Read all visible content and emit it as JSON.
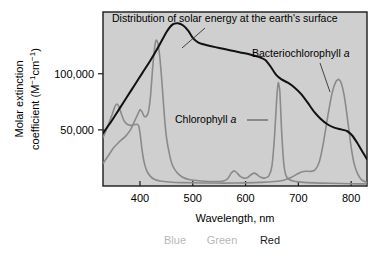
{
  "figure": {
    "background_color": "#ffffff",
    "plot_background_color": "#cfcfcf",
    "frame_color": "#1a1a1a"
  },
  "axes": {
    "x": {
      "title": "Wavelength, nm",
      "ticks": [
        400,
        500,
        600,
        700,
        800
      ],
      "tick_labels": [
        "400",
        "500",
        "600",
        "700",
        "800"
      ],
      "range": [
        330,
        830
      ]
    },
    "y": {
      "title_line1": "Molar extinction",
      "title_line2_prefix": "coefficient (M",
      "title_line2_sup1": "−1",
      "title_line2_mid": "cm",
      "title_line2_sup2": "−1",
      "title_line2_suffix": ")",
      "ticks": [
        50000,
        100000
      ],
      "tick_labels": [
        "50,000",
        "100,000"
      ],
      "range": [
        0,
        155000
      ]
    }
  },
  "spectrum_bands": [
    {
      "name": "blue",
      "label": "Blue",
      "color": "#b8b8b8",
      "x": 175
    },
    {
      "name": "green",
      "label": "Green",
      "color": "#b8b8b8",
      "x": 222
    },
    {
      "name": "red",
      "label": "Red",
      "color": "#1a1a1a",
      "x": 270
    }
  ],
  "annotations": [
    {
      "name": "solar-energy-annotation",
      "text": "Distribution of solar energy at the earth's surface",
      "italic_tail": "",
      "x": 112,
      "y": 22,
      "leader": {
        "x1": 205,
        "y1": 28,
        "x2": 182,
        "y2": 48
      }
    },
    {
      "name": "bacteriochlorophyll-annotation",
      "text": "Bacteriochlorophyll ",
      "italic_tail": "a",
      "x": 252,
      "y": 57,
      "leader": {
        "x1": 320,
        "y1": 63,
        "x2": 330,
        "y2": 92
      }
    },
    {
      "name": "chlorophyll-annotation",
      "text": "Chlorophyll ",
      "italic_tail": "a",
      "x": 175,
      "y": 123,
      "leader": {
        "x1": 247,
        "y1": 120,
        "x2": 268,
        "y2": 120
      }
    }
  ],
  "chart_data": {
    "type": "line",
    "title": "",
    "xlabel": "Wavelength, nm",
    "ylabel": "Molar extinction coefficient (M−1cm−1)",
    "xlim": [
      330,
      830
    ],
    "ylim": [
      0,
      155000
    ],
    "grid": false,
    "legend": "inline-annotations",
    "series": [
      {
        "name": "Distribution of solar energy at the earth's surface",
        "color": "#111111",
        "width": 2.0,
        "points": [
          [
            330,
            47000
          ],
          [
            345,
            57000
          ],
          [
            360,
            68000
          ],
          [
            375,
            79000
          ],
          [
            390,
            90000
          ],
          [
            405,
            101000
          ],
          [
            420,
            112000
          ],
          [
            435,
            124000
          ],
          [
            450,
            137000
          ],
          [
            462,
            144000
          ],
          [
            472,
            145000
          ],
          [
            482,
            143000
          ],
          [
            492,
            138000
          ],
          [
            500,
            132000
          ],
          [
            510,
            128000
          ],
          [
            522,
            126000
          ],
          [
            535,
            124500
          ],
          [
            550,
            123000
          ],
          [
            570,
            121000
          ],
          [
            590,
            119000
          ],
          [
            610,
            117000
          ],
          [
            625,
            115000
          ],
          [
            638,
            112000
          ],
          [
            648,
            106000
          ],
          [
            658,
            99000
          ],
          [
            668,
            95000
          ],
          [
            680,
            92000
          ],
          [
            692,
            88000
          ],
          [
            705,
            82000
          ],
          [
            718,
            74000
          ],
          [
            730,
            66000
          ],
          [
            742,
            60000
          ],
          [
            755,
            55000
          ],
          [
            768,
            52000
          ],
          [
            780,
            50500
          ],
          [
            792,
            49000
          ],
          [
            802,
            45000
          ],
          [
            812,
            38000
          ],
          [
            822,
            30000
          ],
          [
            830,
            24000
          ]
        ]
      },
      {
        "name": "Chlorophyll a",
        "color": "#8a8a8a",
        "width": 1.6,
        "points": [
          [
            330,
            20000
          ],
          [
            340,
            27000
          ],
          [
            350,
            34000
          ],
          [
            360,
            39000
          ],
          [
            372,
            44000
          ],
          [
            382,
            50000
          ],
          [
            390,
            58000
          ],
          [
            396,
            64000
          ],
          [
            400,
            68000
          ],
          [
            404,
            66000
          ],
          [
            408,
            62000
          ],
          [
            412,
            62000
          ],
          [
            416,
            66000
          ],
          [
            420,
            80000
          ],
          [
            424,
            105000
          ],
          [
            428,
            124000
          ],
          [
            431,
            130000
          ],
          [
            434,
            127000
          ],
          [
            438,
            113000
          ],
          [
            442,
            90000
          ],
          [
            446,
            64000
          ],
          [
            450,
            44000
          ],
          [
            456,
            28000
          ],
          [
            462,
            18000
          ],
          [
            470,
            12000
          ],
          [
            480,
            8000
          ],
          [
            495,
            5500
          ],
          [
            515,
            4500
          ],
          [
            540,
            4000
          ],
          [
            558,
            4500
          ],
          [
            566,
            6500
          ],
          [
            573,
            11500
          ],
          [
            578,
            13500
          ],
          [
            583,
            12000
          ],
          [
            590,
            8500
          ],
          [
            597,
            7000
          ],
          [
            604,
            7500
          ],
          [
            610,
            10000
          ],
          [
            616,
            11500
          ],
          [
            621,
            10500
          ],
          [
            628,
            8000
          ],
          [
            636,
            7000
          ],
          [
            644,
            9000
          ],
          [
            650,
            18000
          ],
          [
            655,
            45000
          ],
          [
            659,
            78000
          ],
          [
            662,
            92000
          ],
          [
            665,
            84000
          ],
          [
            668,
            52000
          ],
          [
            672,
            22000
          ],
          [
            676,
            10000
          ],
          [
            682,
            6000
          ],
          [
            692,
            4200
          ],
          [
            710,
            3200
          ],
          [
            740,
            2600
          ],
          [
            780,
            2200
          ],
          [
            820,
            1900
          ],
          [
            830,
            1800
          ]
        ]
      },
      {
        "name": "Bacteriochlorophyll a",
        "color": "#8a8a8a",
        "width": 1.6,
        "points": [
          [
            330,
            43000
          ],
          [
            338,
            52000
          ],
          [
            346,
            62000
          ],
          [
            352,
            70000
          ],
          [
            356,
            73000
          ],
          [
            360,
            71000
          ],
          [
            365,
            64000
          ],
          [
            370,
            58000
          ],
          [
            376,
            55000
          ],
          [
            382,
            54000
          ],
          [
            388,
            54500
          ],
          [
            394,
            55000
          ],
          [
            398,
            53000
          ],
          [
            401,
            44000
          ],
          [
            404,
            32000
          ],
          [
            408,
            21000
          ],
          [
            413,
            13500
          ],
          [
            419,
            9000
          ],
          [
            427,
            6000
          ],
          [
            438,
            4500
          ],
          [
            455,
            3600
          ],
          [
            480,
            3000
          ],
          [
            520,
            2700
          ],
          [
            560,
            2600
          ],
          [
            600,
            2800
          ],
          [
            630,
            3200
          ],
          [
            655,
            4000
          ],
          [
            672,
            5200
          ],
          [
            686,
            7500
          ],
          [
            697,
            10500
          ],
          [
            706,
            12500
          ],
          [
            715,
            13200
          ],
          [
            724,
            13000
          ],
          [
            732,
            14500
          ],
          [
            740,
            22000
          ],
          [
            748,
            40000
          ],
          [
            756,
            63000
          ],
          [
            764,
            83000
          ],
          [
            771,
            93000
          ],
          [
            776,
            95000
          ],
          [
            781,
            92000
          ],
          [
            787,
            80000
          ],
          [
            793,
            60000
          ],
          [
            799,
            38000
          ],
          [
            805,
            21000
          ],
          [
            812,
            11000
          ],
          [
            820,
            5500
          ],
          [
            830,
            3000
          ]
        ]
      }
    ]
  }
}
